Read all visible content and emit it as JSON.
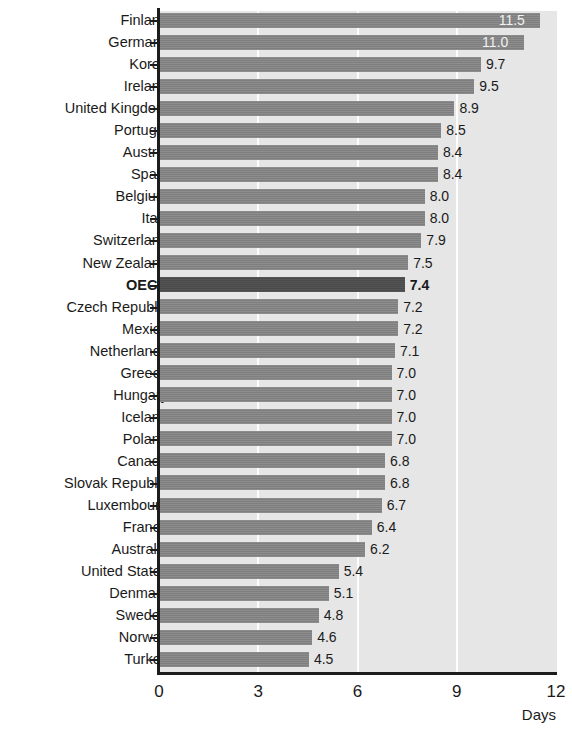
{
  "chart_data": {
    "type": "bar",
    "orientation": "horizontal",
    "title": "",
    "xlabel": "Days",
    "ylabel": "",
    "xlim": [
      0,
      12
    ],
    "xticks": [
      0,
      3,
      6,
      9,
      12
    ],
    "xtick_labels": [
      "0",
      "3",
      "6",
      "9",
      "12"
    ],
    "grid": true,
    "grid_axis": "x",
    "legend": null,
    "highlight_category": "OECD",
    "value_format": "0.0",
    "categories": [
      "Finland",
      "Germany",
      "Korea",
      "Ireland",
      "United Kingdom",
      "Portugal",
      "Austria",
      "Spain",
      "Belgium",
      "Italy",
      "Switzerland",
      "New Zealand",
      "OECD",
      "Czech Republic",
      "Mexico",
      "Netherlands",
      "Greece",
      "Hungary",
      "Iceland",
      "Poland",
      "Canada",
      "Slovak Republic",
      "Luxembourg",
      "France",
      "Australia",
      "United States",
      "Denmark",
      "Sweden",
      "Norway",
      "Turkey"
    ],
    "values": [
      11.5,
      11.0,
      9.7,
      9.5,
      8.9,
      8.5,
      8.4,
      8.4,
      8.0,
      8.0,
      7.9,
      7.5,
      7.4,
      7.2,
      7.2,
      7.1,
      7.0,
      7.0,
      7.0,
      7.0,
      6.8,
      6.8,
      6.7,
      6.4,
      6.2,
      5.4,
      5.1,
      4.8,
      4.6,
      4.5
    ],
    "value_labels": [
      "11.5",
      "11.0",
      "9.7",
      "9.5",
      "8.9",
      "8.5",
      "8.4",
      "8.4",
      "8.0",
      "8.0",
      "7.9",
      "7.5",
      "7.4",
      "7.2",
      "7.2",
      "7.1",
      "7.0",
      "7.0",
      "7.0",
      "7.0",
      "6.8",
      "6.8",
      "6.7",
      "6.4",
      "6.2",
      "5.4",
      "5.1",
      "4.8",
      "4.6",
      "4.5"
    ],
    "colors": {
      "bar": "#858585",
      "bar_highlight": "#4f4f4f",
      "plot_background": "#e6e6e6",
      "gridline": "#fdfdfd",
      "axis": "#1c1c1c",
      "text": "#1a1a1a",
      "label_inside": "#f2f2f2"
    }
  }
}
